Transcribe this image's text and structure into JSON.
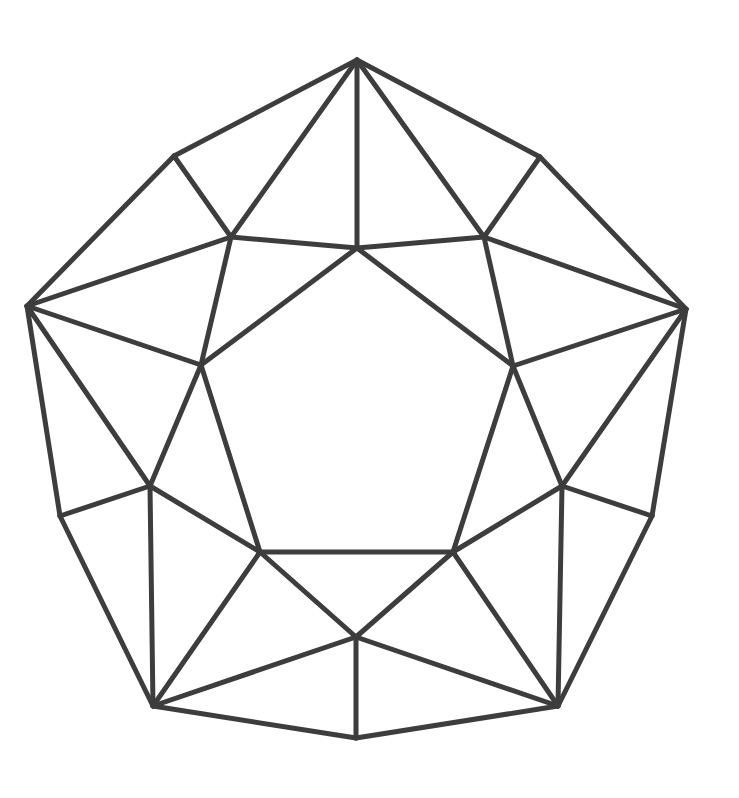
{
  "figure": {
    "type": "polyhedron-line-drawing",
    "stroke_color": "#3d3d3d",
    "background": "#ffffff",
    "vertices": {
      "T": [
        357,
        60
      ],
      "UL": [
        174,
        156
      ],
      "UR": [
        540,
        157
      ],
      "L": [
        27,
        306
      ],
      "R": [
        686,
        309
      ],
      "ML": [
        60,
        516
      ],
      "MR": [
        652,
        516
      ],
      "BL": [
        153,
        706
      ],
      "BR": [
        558,
        706
      ],
      "B": [
        356,
        738
      ],
      "A1": [
        231,
        237
      ],
      "A2": [
        484,
        237
      ],
      "A3": [
        357,
        248
      ],
      "B1": [
        201,
        365
      ],
      "B2": [
        513,
        366
      ],
      "C1": [
        150,
        486
      ],
      "C2": [
        562,
        486
      ],
      "D1": [
        260,
        552
      ],
      "D2": [
        453,
        552
      ],
      "E": [
        356,
        637
      ]
    },
    "edges": [
      [
        "T",
        "UL"
      ],
      [
        "T",
        "UR"
      ],
      [
        "T",
        "A1"
      ],
      [
        "T",
        "A3"
      ],
      [
        "T",
        "A2"
      ],
      [
        "UL",
        "A1"
      ],
      [
        "UL",
        "L"
      ],
      [
        "UR",
        "A2"
      ],
      [
        "UR",
        "R"
      ],
      [
        "A1",
        "A3"
      ],
      [
        "A3",
        "A2"
      ],
      [
        "L",
        "A1"
      ],
      [
        "R",
        "A2"
      ],
      [
        "L",
        "B1"
      ],
      [
        "R",
        "B2"
      ],
      [
        "A1",
        "B1"
      ],
      [
        "A2",
        "B2"
      ],
      [
        "A3",
        "B1"
      ],
      [
        "A3",
        "B2"
      ],
      [
        "L",
        "ML"
      ],
      [
        "L",
        "C1"
      ],
      [
        "R",
        "MR"
      ],
      [
        "R",
        "C2"
      ],
      [
        "B1",
        "C1"
      ],
      [
        "B2",
        "C2"
      ],
      [
        "B1",
        "D1"
      ],
      [
        "B2",
        "D2"
      ],
      [
        "ML",
        "C1"
      ],
      [
        "MR",
        "C2"
      ],
      [
        "C1",
        "D1"
      ],
      [
        "C2",
        "D2"
      ],
      [
        "C1",
        "BL"
      ],
      [
        "C2",
        "BR"
      ],
      [
        "ML",
        "BL"
      ],
      [
        "MR",
        "BR"
      ],
      [
        "D1",
        "D2"
      ],
      [
        "D1",
        "BL"
      ],
      [
        "D2",
        "BR"
      ],
      [
        "D1",
        "E"
      ],
      [
        "D2",
        "E"
      ],
      [
        "BL",
        "E"
      ],
      [
        "BR",
        "E"
      ],
      [
        "E",
        "B"
      ],
      [
        "BL",
        "B"
      ],
      [
        "BR",
        "B"
      ]
    ]
  }
}
